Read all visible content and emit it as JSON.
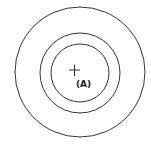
{
  "diagram": {
    "center": {
      "x": 80,
      "y": 72
    },
    "circles": [
      {
        "name": "outer",
        "r": 65
      },
      {
        "name": "middle",
        "r": 40
      },
      {
        "name": "inner",
        "r": 29
      }
    ],
    "marker": {
      "symbol": "plus",
      "x": 74,
      "y": 70,
      "label": "(A)"
    },
    "stroke_color": "#333333"
  }
}
